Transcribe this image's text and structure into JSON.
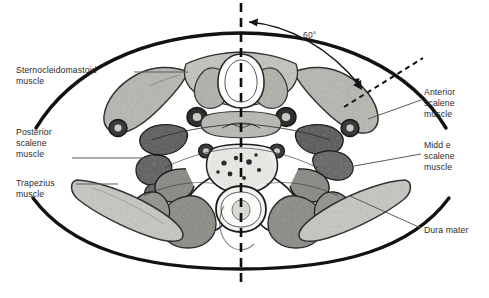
{
  "figure": {
    "type": "axial-neck-cross-section-anatomical-illustration",
    "background_color": "#ffffff",
    "ink_color": "#1a1a1a",
    "text_color": "#2b2b2b",
    "width": 489,
    "height": 298
  },
  "annotations": {
    "angle": {
      "value": "60°",
      "x": 303,
      "y": 30
    },
    "midline": {
      "name": "vertical-dashed-midline",
      "style": "dashed",
      "x": 241,
      "y_top": 3,
      "y_bottom": 283
    },
    "oblique": {
      "name": "oblique-dashed-needle-path",
      "style": "dashed",
      "x1": 344,
      "y1": 107,
      "x2": 423,
      "y2": 58
    }
  },
  "labels": [
    {
      "id": "sternocleidomastoid",
      "text": "Sternocleidomastoid\nmuscle",
      "side": "left",
      "x": 16,
      "y": 65,
      "leader": {
        "x1": 134,
        "y1": 72,
        "x2": 186,
        "y2": 72
      }
    },
    {
      "id": "posterior-scalene",
      "text": "Posterior\nscalene\nmuscle",
      "side": "left",
      "x": 16,
      "y": 127,
      "leader": {
        "x1": 72,
        "y1": 158,
        "x2": 150,
        "y2": 158
      }
    },
    {
      "id": "trapezius",
      "text": "Trapezius\nmuscle",
      "side": "left",
      "x": 16,
      "y": 178,
      "leader": {
        "x1": 76,
        "y1": 184,
        "x2": 116,
        "y2": 184
      }
    },
    {
      "id": "anterior-scalene",
      "text": "Anterior\nscalene\nmuscle",
      "side": "right",
      "x": 424,
      "y": 87,
      "leader": {
        "x1": 370,
        "y1": 118,
        "x2": 421,
        "y2": 100
      }
    },
    {
      "id": "middle-scalene",
      "text": "Midd e\nscalene\nmuscle",
      "side": "right",
      "x": 424,
      "y": 140,
      "leader": {
        "x1": 356,
        "y1": 165,
        "x2": 421,
        "y2": 154
      }
    },
    {
      "id": "dura-mater",
      "text": "Dura mater",
      "side": "right",
      "x": 424,
      "y": 225,
      "leader": {
        "x1": 352,
        "y1": 196,
        "x2": 421,
        "y2": 228
      }
    }
  ],
  "structures": [
    {
      "name": "skin-outline-superior",
      "kind": "contour"
    },
    {
      "name": "skin-outline-inferior",
      "kind": "contour"
    },
    {
      "name": "trachea",
      "kind": "airway",
      "fill": "#ffffff"
    },
    {
      "name": "thyroid-gland",
      "kind": "gland",
      "fill": "#b9b9b4"
    },
    {
      "name": "sternocleidomastoid-muscle-left",
      "kind": "muscle",
      "fill": "#b4b4ae"
    },
    {
      "name": "sternocleidomastoid-muscle-right",
      "kind": "muscle",
      "fill": "#b4b4ae"
    },
    {
      "name": "carotid-artery-left",
      "kind": "vessel",
      "fill": "#3c3c3c"
    },
    {
      "name": "carotid-artery-right",
      "kind": "vessel",
      "fill": "#3c3c3c"
    },
    {
      "name": "jugular-vein-left",
      "kind": "vessel",
      "fill": "#4a4a4a"
    },
    {
      "name": "jugular-vein-right",
      "kind": "vessel",
      "fill": "#4a4a4a"
    },
    {
      "name": "anterior-scalene-muscle",
      "kind": "muscle",
      "fill": "#5e5e5e"
    },
    {
      "name": "middle-scalene-muscle",
      "kind": "muscle",
      "fill": "#6a6a6a"
    },
    {
      "name": "posterior-scalene-muscle",
      "kind": "muscle",
      "fill": "#585858"
    },
    {
      "name": "vertebral-body",
      "kind": "bone",
      "fill": "#e8e8e4"
    },
    {
      "name": "spinal-canal-dura-mater",
      "kind": "meninges",
      "fill": "#f2f2ee"
    },
    {
      "name": "paraspinal-muscles",
      "kind": "muscle",
      "fill": "#8c8c86"
    },
    {
      "name": "trapezius-muscle-left",
      "kind": "muscle",
      "fill": "#c4c4be"
    },
    {
      "name": "trapezius-muscle-right",
      "kind": "muscle",
      "fill": "#c4c4be"
    }
  ]
}
